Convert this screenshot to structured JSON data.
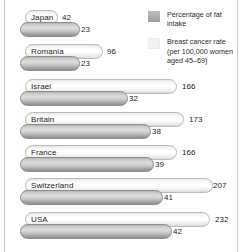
{
  "chart_data": {
    "type": "bar",
    "title": "",
    "xlabel": "",
    "ylabel": "",
    "orientation": "horizontal",
    "categories": [
      "Japan",
      "Romania",
      "Israel",
      "Britain",
      "France",
      "Switzerland",
      "USA"
    ],
    "series": [
      {
        "name": "Breast cancer rate (per 100,000 women aged 45-69)",
        "key": "breast_cancer_rate",
        "color": "#f4f4f4",
        "values": [
          42,
          96,
          166,
          173,
          166,
          207,
          232
        ]
      },
      {
        "name": "Percentage of fat intake",
        "key": "fat_intake_pct",
        "color": "#adadad",
        "values": [
          23,
          23,
          32,
          38,
          39,
          41,
          42
        ]
      }
    ],
    "xlim_rate": [
      0,
      232
    ],
    "xlim_fat": [
      0,
      42
    ],
    "grid": false,
    "legend_position": "top-right"
  },
  "legend": {
    "items": [
      {
        "swatch": "dark",
        "label": "Percentage of fat intake"
      },
      {
        "swatch": "light",
        "label": "Breast cancer rate\n(per 100,000 women\naged 45–69)"
      }
    ]
  },
  "rows": [
    {
      "country": "Japan",
      "rate": "42",
      "fat": "23"
    },
    {
      "country": "Romania",
      "rate": "96",
      "fat": "23"
    },
    {
      "country": "Israel",
      "rate": "166",
      "fat": "32"
    },
    {
      "country": "Britain",
      "rate": "173",
      "fat": "38"
    },
    {
      "country": "France",
      "rate": "166",
      "fat": "39"
    },
    {
      "country": "Switzerland",
      "rate": "207",
      "fat": "41"
    },
    {
      "country": "USA",
      "rate": "232",
      "fat": "42"
    }
  ],
  "geometry": {
    "group_tops": [
      10,
      44,
      79,
      112,
      145,
      178,
      212
    ],
    "light_widths": [
      33,
      78,
      152,
      159,
      152,
      188,
      185
    ],
    "dark_widths": [
      60,
      60,
      108,
      131,
      134,
      143,
      152
    ],
    "light_label_x": [
      62,
      107,
      182,
      189,
      182,
      213,
      215
    ],
    "dark_label_x": [
      81,
      81,
      129,
      152,
      155,
      164,
      173
    ]
  }
}
